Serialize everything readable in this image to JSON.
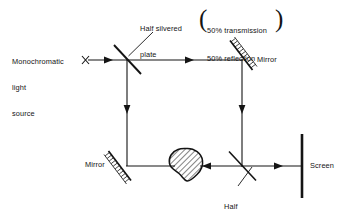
{
  "figure": {
    "ink_color": "#141414",
    "background_color": "#ffffff"
  },
  "labels": {
    "source": "Monochromatic\nlight\nsource",
    "source_line1": "Monochromatic",
    "source_line2": "light",
    "source_line3": "source",
    "half_silvered_plate_top": "Half silvered\nplate",
    "half_silvered_top_line1": "Half silvered",
    "half_silvered_top_line2": "plate",
    "note_line1": "50% transmission",
    "note_line2": "50% reflection",
    "paren_open": "(",
    "paren_close": ")",
    "mirror_top_right": "Mirror",
    "mirror_bottom_left": "Mirror",
    "half_silvered_plate_bottom_line1": "Half",
    "half_silvered_plate_bottom_line2": "silvered",
    "half_silvered_plate_bottom_line3": "plate",
    "screen": "Screen"
  },
  "components": [
    {
      "name": "monochromatic-light-source-marker",
      "glyph": "x-marker",
      "x": 85,
      "y": 60
    },
    {
      "name": "beam-splitter-top-left",
      "type": "half-silvered-plate",
      "x1": 114,
      "y1": 45,
      "x2": 141,
      "y2": 74
    },
    {
      "name": "mirror-top-right",
      "type": "mirror",
      "x1": 231,
      "y1": 41,
      "x2": 253,
      "y2": 70
    },
    {
      "name": "mirror-bottom-left",
      "type": "mirror",
      "x1": 105,
      "y1": 152,
      "x2": 131,
      "y2": 181
    },
    {
      "name": "specimen-blob",
      "type": "hatched-object",
      "cx": 187,
      "cy": 166
    },
    {
      "name": "beam-splitter-bottom-right",
      "type": "half-silvered-plate",
      "x1": 229,
      "y1": 152,
      "x2": 256,
      "y2": 180
    },
    {
      "name": "screen",
      "type": "screen",
      "x": 302,
      "y1": 135,
      "y2": 198
    }
  ],
  "beams": [
    {
      "name": "beam-source-to-splitter",
      "from": [
        88,
        60
      ],
      "to": [
        127,
        60
      ],
      "arrow_at": [
        112,
        60
      ],
      "direction": "right"
    },
    {
      "name": "beam-top-horizontal",
      "from": [
        127,
        60
      ],
      "to": [
        242,
        60
      ],
      "arrow_at": [
        193,
        60
      ],
      "direction": "right"
    },
    {
      "name": "beam-left-vertical",
      "from": [
        127,
        60
      ],
      "to": [
        127,
        166
      ],
      "arrow_at": [
        127,
        113
      ],
      "direction": "down"
    },
    {
      "name": "beam-right-vertical",
      "from": [
        242,
        60
      ],
      "to": [
        242,
        166
      ],
      "arrow_at": [
        242,
        113
      ],
      "direction": "down"
    },
    {
      "name": "beam-bottom-left-to-blob",
      "from": [
        127,
        166
      ],
      "to": [
        172,
        166
      ],
      "direction": "right"
    },
    {
      "name": "beam-blob-to-splitter",
      "from": [
        202,
        166
      ],
      "to": [
        242,
        166
      ],
      "arrow_at": [
        208,
        166
      ],
      "direction": "left"
    },
    {
      "name": "beam-splitter-to-screen",
      "from": [
        242,
        166
      ],
      "to": [
        302,
        166
      ],
      "arrow_at": [
        282,
        166
      ],
      "direction": "right"
    }
  ],
  "leaders": [
    {
      "name": "leader-half-silvered-top",
      "from": [
        152,
        33
      ],
      "to": [
        129,
        55
      ]
    },
    {
      "name": "leader-half-silvered-bottom",
      "from": [
        252,
        168
      ],
      "to": [
        237,
        186
      ]
    }
  ]
}
